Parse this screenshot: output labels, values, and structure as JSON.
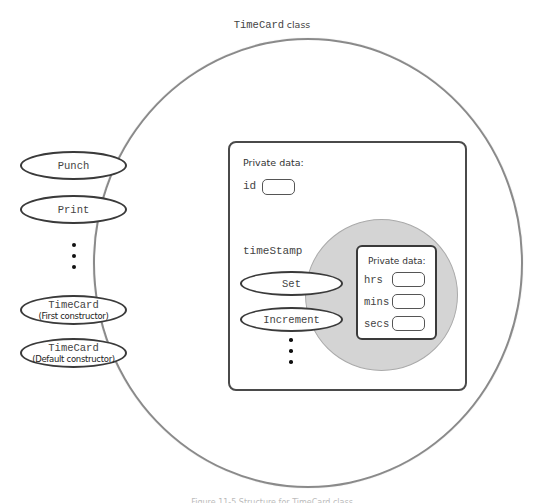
{
  "class_diagram": {
    "title_code": "TimeCard",
    "title_word": "class",
    "public_methods": [
      {
        "name": "Punch",
        "sub": ""
      },
      {
        "name": "Print",
        "sub": ""
      },
      {
        "name": "TimeCard",
        "sub": "(First constructor)"
      },
      {
        "name": "TimeCard",
        "sub": "(Default constructor)"
      }
    ],
    "ellipsis_dots": 3,
    "private_section": {
      "label": "Private data:",
      "fields": [
        {
          "name": "id"
        }
      ],
      "member_object": {
        "name": "timeStamp",
        "methods": [
          {
            "name": "Set"
          },
          {
            "name": "Increment"
          }
        ],
        "private_label": "Private data:",
        "fields": [
          {
            "name": "hrs"
          },
          {
            "name": "mins"
          },
          {
            "name": "secs"
          }
        ]
      }
    },
    "colors": {
      "outline": "#3a3a3a",
      "class_circle": "#8a8a8a",
      "member_fill": "#d4d4d4"
    }
  },
  "caption": "Figure 11-5 Structure for TimeCard class"
}
